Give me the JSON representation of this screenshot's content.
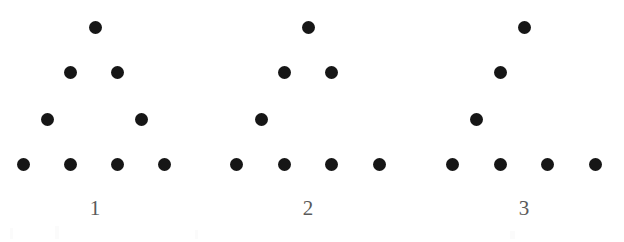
{
  "canvas": {
    "width": 624,
    "height": 242,
    "background_color": "#ffffff"
  },
  "style": {
    "dot_color": "#161616",
    "dot_diameter": 13,
    "label_color": "#5a5a5a",
    "label_font_size": 21
  },
  "chart_data": {
    "type": "scatter",
    "title": "",
    "subtitle": "",
    "xlabel": "",
    "ylabel": "",
    "grid": false,
    "legend": null,
    "row_y": [
      27,
      72,
      119,
      164
    ],
    "label_y": 208,
    "series": [
      {
        "name": "1",
        "label": "1",
        "label_x": 95,
        "dot_count": 9,
        "points": [
          {
            "x": 95,
            "y": 27,
            "row": 1
          },
          {
            "x": 70,
            "y": 72,
            "row": 2
          },
          {
            "x": 117,
            "y": 72,
            "row": 2
          },
          {
            "x": 47,
            "y": 119,
            "row": 3
          },
          {
            "x": 141,
            "y": 119,
            "row": 3
          },
          {
            "x": 23,
            "y": 164,
            "row": 4
          },
          {
            "x": 70,
            "y": 164,
            "row": 4
          },
          {
            "x": 117,
            "y": 164,
            "row": 4
          },
          {
            "x": 164,
            "y": 164,
            "row": 4
          }
        ]
      },
      {
        "name": "2",
        "label": "2",
        "label_x": 308,
        "dot_count": 8,
        "points": [
          {
            "x": 308,
            "y": 27,
            "row": 1
          },
          {
            "x": 284,
            "y": 72,
            "row": 2
          },
          {
            "x": 331,
            "y": 72,
            "row": 2
          },
          {
            "x": 261,
            "y": 119,
            "row": 3
          },
          {
            "x": 236,
            "y": 164,
            "row": 4
          },
          {
            "x": 284,
            "y": 164,
            "row": 4
          },
          {
            "x": 331,
            "y": 164,
            "row": 4
          },
          {
            "x": 379,
            "y": 164,
            "row": 4
          }
        ]
      },
      {
        "name": "3",
        "label": "3",
        "label_x": 524,
        "dot_count": 7,
        "points": [
          {
            "x": 524,
            "y": 27,
            "row": 1
          },
          {
            "x": 500,
            "y": 72,
            "row": 2
          },
          {
            "x": 476,
            "y": 119,
            "row": 3
          },
          {
            "x": 452,
            "y": 164,
            "row": 4
          },
          {
            "x": 500,
            "y": 164,
            "row": 4
          },
          {
            "x": 547,
            "y": 164,
            "row": 4
          },
          {
            "x": 595,
            "y": 164,
            "row": 4
          }
        ]
      }
    ]
  },
  "artifacts": [
    {
      "x": 10,
      "y": 228,
      "width": 3,
      "height": 11
    },
    {
      "x": 55,
      "y": 226,
      "width": 4,
      "height": 13
    },
    {
      "x": 195,
      "y": 230,
      "width": 3,
      "height": 9
    },
    {
      "x": 510,
      "y": 231,
      "width": 5,
      "height": 8
    }
  ]
}
